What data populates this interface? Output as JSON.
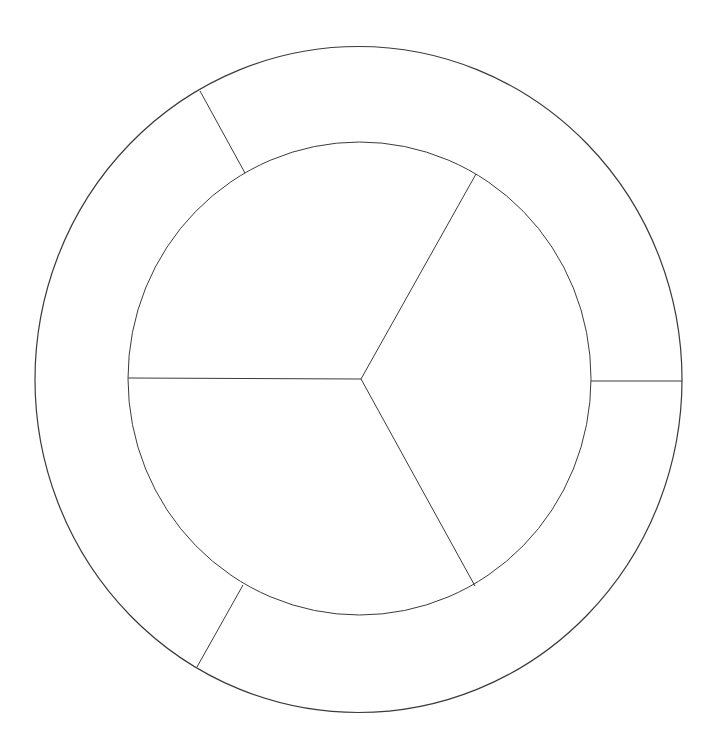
{
  "diagram": {
    "type": "two-level-ring-diagram",
    "canvas": {
      "width": 717,
      "height": 751,
      "background": "#ffffff"
    },
    "stroke_color": "#3a3a3a",
    "outer_ring": {
      "cx": 358.5,
      "cy": 379.5,
      "rx": 323.5,
      "ry": 333,
      "segments": 3,
      "dividers": [
        {
          "x1": 591,
          "y1": 381,
          "x2": 682,
          "y2": 381
        },
        {
          "x1": 245,
          "y1": 173,
          "x2": 200,
          "y2": 91
        },
        {
          "x1": 243,
          "y1": 585,
          "x2": 197,
          "y2": 667
        }
      ],
      "labels": []
    },
    "inner_circle": {
      "cx": 359.5,
      "cy": 378.5,
      "rx": 231.5,
      "ry": 236.5,
      "segments": 3,
      "hub": {
        "x": 361,
        "y": 379
      },
      "spokes": [
        {
          "x2": 128,
          "y2": 378
        },
        {
          "x2": 476,
          "y2": 174
        },
        {
          "x2": 475,
          "y2": 586
        }
      ],
      "labels": []
    }
  }
}
